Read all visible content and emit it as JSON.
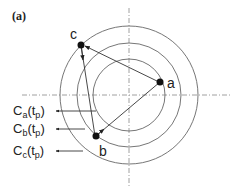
{
  "panel_label": "(a)",
  "points": [
    {
      "id": "a",
      "label": "a"
    },
    {
      "id": "b",
      "label": "b"
    },
    {
      "id": "c",
      "label": "c"
    }
  ],
  "contours": [
    {
      "base": "C",
      "sub": "a",
      "arg": "(t",
      "argsub": "p",
      "close": ")"
    },
    {
      "base": "C",
      "sub": "b",
      "arg": "(t",
      "argsub": "p",
      "close": ")"
    },
    {
      "base": "C",
      "sub": "c",
      "arg": "(t",
      "argsub": "p",
      "close": ")"
    }
  ],
  "colors": {
    "stroke": "#333333",
    "ring": "#666666",
    "axis": "#888888",
    "text": "#222222"
  }
}
